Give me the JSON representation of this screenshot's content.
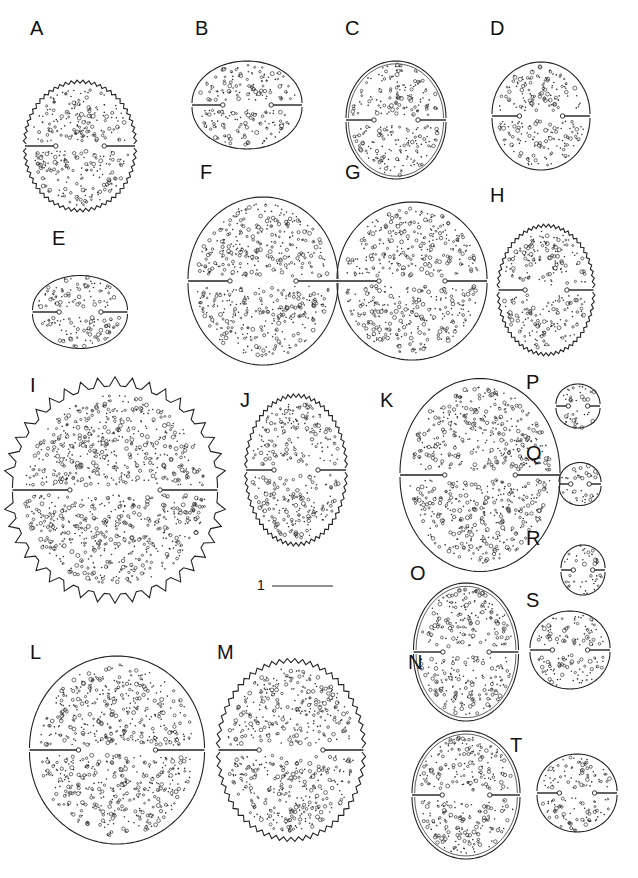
{
  "figure": {
    "panels": [
      {
        "id": "A",
        "x": 30,
        "y": 38,
        "cx": 80,
        "cy": 146,
        "w": 110,
        "h": 130,
        "style": "rough"
      },
      {
        "id": "B",
        "x": 195,
        "y": 38,
        "cx": 247,
        "cy": 105,
        "w": 110,
        "h": 90,
        "style": "smooth"
      },
      {
        "id": "C",
        "x": 345,
        "y": 38,
        "cx": 396,
        "cy": 120,
        "w": 100,
        "h": 120,
        "style": "double"
      },
      {
        "id": "D",
        "x": 490,
        "y": 38,
        "cx": 541,
        "cy": 116,
        "w": 98,
        "h": 110,
        "style": "smooth"
      },
      {
        "id": "E",
        "x": 52,
        "y": 248,
        "cx": 80,
        "cy": 312,
        "w": 95,
        "h": 75,
        "style": "smooth"
      },
      {
        "id": "F",
        "x": 200,
        "y": 182,
        "cx": 263,
        "cy": 281,
        "w": 150,
        "h": 170,
        "style": "smooth"
      },
      {
        "id": "G",
        "x": 345,
        "y": 182,
        "cx": 412,
        "cy": 281,
        "w": 150,
        "h": 160,
        "style": "smooth"
      },
      {
        "id": "H",
        "x": 490,
        "y": 205,
        "cx": 546,
        "cy": 290,
        "w": 95,
        "h": 130,
        "style": "rough"
      },
      {
        "id": "I",
        "x": 30,
        "y": 395,
        "cx": 115,
        "cy": 490,
        "w": 205,
        "h": 210,
        "style": "spiny"
      },
      {
        "id": "J",
        "x": 240,
        "y": 410,
        "cx": 296,
        "cy": 470,
        "w": 100,
        "h": 150,
        "style": "rough"
      },
      {
        "id": "K",
        "x": 380,
        "y": 410,
        "cx": 480,
        "cy": 475,
        "w": 160,
        "h": 195,
        "style": "smooth"
      },
      {
        "id": "P",
        "x": 526,
        "y": 392,
        "cx": 578,
        "cy": 406,
        "w": 44,
        "h": 46,
        "style": "smooth"
      },
      {
        "id": "Q",
        "x": 526,
        "y": 463,
        "cx": 580,
        "cy": 484,
        "w": 42,
        "h": 45,
        "style": "smooth"
      },
      {
        "id": "R",
        "x": 526,
        "y": 548,
        "cx": 583,
        "cy": 570,
        "w": 44,
        "h": 52,
        "style": "smooth"
      },
      {
        "id": "S",
        "x": 526,
        "y": 610,
        "cx": 570,
        "cy": 650,
        "w": 80,
        "h": 80,
        "style": "smooth"
      },
      {
        "id": "O",
        "x": 410,
        "y": 583,
        "cx": 466,
        "cy": 652,
        "w": 105,
        "h": 140,
        "style": "double"
      },
      {
        "id": "L",
        "x": 30,
        "y": 662,
        "cx": 117,
        "cy": 750,
        "w": 175,
        "h": 190,
        "style": "smooth"
      },
      {
        "id": "M",
        "x": 217,
        "y": 662,
        "cx": 291,
        "cy": 750,
        "w": 145,
        "h": 180,
        "style": "rough"
      },
      {
        "id": "N",
        "x": 408,
        "y": 672,
        "cx": 466,
        "cy": 795,
        "w": 108,
        "h": 130,
        "style": "double"
      },
      {
        "id": "T",
        "x": 510,
        "y": 755,
        "cx": 577,
        "cy": 793,
        "w": 80,
        "h": 80,
        "style": "smooth"
      }
    ],
    "scale_bar": {
      "label": "1",
      "x1": 272,
      "x2": 333,
      "y": 586
    }
  }
}
